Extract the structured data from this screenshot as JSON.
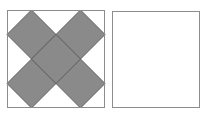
{
  "figure": {
    "title": "Two squares: left square tiled with five shaded diamonds, right square empty",
    "background_color": "#ffffff",
    "canvas": {
      "width": 208,
      "height": 116
    }
  },
  "colors": {
    "diamond_fill": "#8a8a8a",
    "diamond_stroke": "#5f5f5f",
    "square_border": "#8c8c8c",
    "square_fill": "#ffffff",
    "page_background": "#ffffff"
  },
  "panels": [
    {
      "id": "left-panel",
      "label": "Shaded diamond pattern square",
      "x": 7,
      "y": 10,
      "width": 98,
      "height": 98,
      "border_width": 1,
      "filled": true,
      "shape_count": 5,
      "pattern": "quincunx"
    },
    {
      "id": "right-panel",
      "label": "Empty square",
      "x": 112,
      "y": 11,
      "width": 88,
      "height": 97,
      "border_width": 1,
      "filled": false,
      "shape_count": 0,
      "pattern": "none"
    }
  ],
  "chart_data": {
    "type": "diagram",
    "title": "Two squares: left square tiled with five shaded diamonds, right square empty",
    "shapes": [
      {
        "name": "left-square-outline",
        "kind": "rect",
        "x": 7,
        "y": 10,
        "width": 98,
        "height": 98,
        "fill": "#ffffff",
        "stroke": "#8c8c8c"
      },
      {
        "name": "diamond-top-left",
        "kind": "diamond",
        "cx": 31.5,
        "cy": 34.5,
        "half_diagonal": 24.5,
        "fill": "#8a8a8a",
        "stroke": "#5f5f5f"
      },
      {
        "name": "diamond-top-right",
        "kind": "diamond",
        "cx": 80.5,
        "cy": 34.5,
        "half_diagonal": 24.5,
        "fill": "#8a8a8a",
        "stroke": "#5f5f5f"
      },
      {
        "name": "diamond-center",
        "kind": "diamond",
        "cx": 56,
        "cy": 59,
        "half_diagonal": 24.5,
        "fill": "#8a8a8a",
        "stroke": "#5f5f5f"
      },
      {
        "name": "diamond-bottom-left",
        "kind": "diamond",
        "cx": 31.5,
        "cy": 83.5,
        "half_diagonal": 24.5,
        "fill": "#8a8a8a",
        "stroke": "#5f5f5f"
      },
      {
        "name": "diamond-bottom-right",
        "kind": "diamond",
        "cx": 80.5,
        "cy": 83.5,
        "half_diagonal": 24.5,
        "fill": "#8a8a8a",
        "stroke": "#5f5f5f"
      },
      {
        "name": "right-square-outline",
        "kind": "rect",
        "x": 112,
        "y": 11,
        "width": 88,
        "height": 97,
        "fill": "#ffffff",
        "stroke": "#8c8c8c"
      }
    ],
    "xlabel": "",
    "ylabel": "",
    "grid": false,
    "legend": []
  }
}
